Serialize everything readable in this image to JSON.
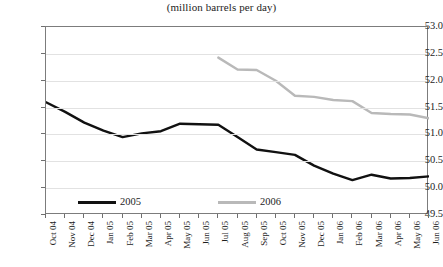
{
  "chart_data": {
    "type": "line",
    "title": "(million barrels per day)",
    "xlabel": "",
    "ylabel": "",
    "ylim": [
      49.5,
      53.0
    ],
    "ytick_step": 0.5,
    "yticks": [
      "53.0",
      "52.5",
      "52.0",
      "51.5",
      "51.0",
      "50.5",
      "50.0",
      "49.5"
    ],
    "ytick_values": [
      53.0,
      52.5,
      52.0,
      51.5,
      51.0,
      50.5,
      50.0,
      49.5
    ],
    "grid": true,
    "legend_position": "inside-bottom-left",
    "categories": [
      "Oct 04",
      "Nov 04",
      "Dec 04",
      "Jan 05",
      "Feb 05",
      "Mar 05",
      "Apr 05",
      "May 05",
      "Jun 05",
      "Jul 05",
      "Aug 05",
      "Sep 05",
      "Oct 05",
      "Nov 05",
      "Dec 05",
      "Jan 06",
      "Feb 06",
      "Mar 06",
      "Apr 06",
      "May 06",
      "Jun 06"
    ],
    "series": [
      {
        "name": "2005",
        "color": "#111111",
        "values": [
          51.6,
          51.42,
          51.22,
          51.07,
          50.95,
          51.02,
          51.06,
          51.2,
          51.19,
          51.18,
          50.95,
          50.72,
          50.67,
          50.62,
          50.42,
          50.27,
          50.15,
          50.25,
          50.18,
          50.19,
          50.22
        ]
      },
      {
        "name": "2006",
        "color": "#b9b9b9",
        "values": [
          null,
          null,
          null,
          null,
          null,
          null,
          null,
          null,
          null,
          52.43,
          52.21,
          52.2,
          52.0,
          51.72,
          51.7,
          51.64,
          51.62,
          51.4,
          51.38,
          51.37,
          51.3
        ]
      }
    ]
  },
  "legend": {
    "entries": [
      {
        "label": "2005",
        "color": "#111111"
      },
      {
        "label": "2006",
        "color": "#b9b9b9"
      }
    ]
  }
}
